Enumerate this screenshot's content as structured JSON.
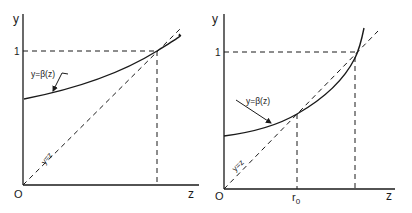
{
  "diagrams": [
    {
      "id": "left",
      "axis_y_label": "y",
      "axis_x_label": "z",
      "origin_label": "O",
      "y_tick_label": "1",
      "curve_label": "y=β(z)",
      "diagonal_label": "y=z"
    },
    {
      "id": "right",
      "axis_y_label": "y",
      "axis_x_label": "z",
      "origin_label": "O",
      "y_tick_label": "1",
      "curve_label": "y=β(z)",
      "diagonal_label": "y=z",
      "x_tick_label": "r",
      "x_tick_subscript": "0"
    }
  ],
  "colors": {
    "ink": "#1a1a1a",
    "background": "#ffffff"
  }
}
